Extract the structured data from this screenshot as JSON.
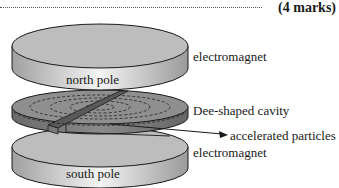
{
  "header": {
    "answer_line": "dotted",
    "marks": "(4 marks)"
  },
  "diagram": {
    "components": {
      "top_magnet_face": "north pole",
      "bottom_magnet_face": "south pole",
      "middle": "Dee-shaped cavity"
    },
    "labels": {
      "top_electromagnet": "electromagnet",
      "dee_cavity": "Dee-shaped cavity",
      "particles": "accelerated particles",
      "bottom_electromagnet": "electromagnet"
    },
    "colors": {
      "magnet_top": "#bdbdbd",
      "magnet_side_light": "#f0f0f0",
      "magnet_side_dark": "#9a9a9a",
      "dee_top": "#8f8f8f",
      "dee_side": "#6e6e6e",
      "outline": "#1a1a1a"
    }
  }
}
